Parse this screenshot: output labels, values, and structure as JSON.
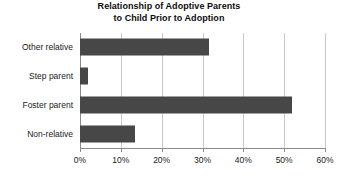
{
  "chart_data": {
    "type": "bar",
    "orientation": "horizontal",
    "title": "Relationship of Adoptive Parents to Child Prior to Adoption",
    "title_lines": [
      "Relationship of Adoptive Parents",
      "to Child Prior to Adoption"
    ],
    "categories": [
      "Other relative",
      "Step parent",
      "Foster parent",
      "Non-relative"
    ],
    "values": [
      31.5,
      2,
      52,
      13.5
    ],
    "value_unit": "%",
    "xlabel": "",
    "ylabel": "",
    "xlim": [
      0,
      60
    ],
    "xticks": [
      0,
      10,
      20,
      30,
      40,
      50,
      60
    ],
    "xtick_labels": [
      "0%",
      "10%",
      "20%",
      "30%",
      "40%",
      "50%",
      "60%"
    ],
    "grid": "vertical",
    "legend": "none",
    "bar_color": "#474747",
    "gridline_color": "#c9c9c9",
    "axis_color": "#8a8a8a",
    "background_color": "#ffffff"
  }
}
